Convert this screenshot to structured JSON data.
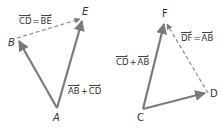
{
  "colors": {
    "vector": "#7a7a7a",
    "dashed": "#8a8a8a",
    "text": "#333333",
    "background": "#ffffff"
  },
  "left_figure": {
    "points": {
      "A": {
        "label": "A",
        "x": 57,
        "y": 108
      },
      "B": {
        "label": "B",
        "x": 17,
        "y": 38
      },
      "E": {
        "label": "E",
        "x": 83,
        "y": 18
      }
    },
    "vectors": [
      {
        "from": "A",
        "to": "B",
        "style": "solid"
      },
      {
        "from": "B",
        "to": "E",
        "style": "dashed"
      },
      {
        "from": "A",
        "to": "E",
        "style": "solid"
      }
    ],
    "equation_top": {
      "lhs": "CD",
      "op": "=",
      "rhs": "BE"
    },
    "equation_side": {
      "lhs": "AB",
      "op": "+",
      "rhs": "CD"
    }
  },
  "right_figure": {
    "points": {
      "C": {
        "label": "C",
        "x": 143,
        "y": 109
      },
      "D": {
        "label": "D",
        "x": 208,
        "y": 93
      },
      "F": {
        "label": "F",
        "x": 165,
        "y": 21
      }
    },
    "vectors": [
      {
        "from": "C",
        "to": "D",
        "style": "solid"
      },
      {
        "from": "D",
        "to": "F",
        "style": "dashed"
      },
      {
        "from": "C",
        "to": "F",
        "style": "solid"
      }
    ],
    "equation_side": {
      "lhs": "CD",
      "op": "+",
      "rhs": "AB"
    },
    "equation_dashed": {
      "lhs": "DF",
      "op": "=",
      "rhs": "AB"
    }
  }
}
